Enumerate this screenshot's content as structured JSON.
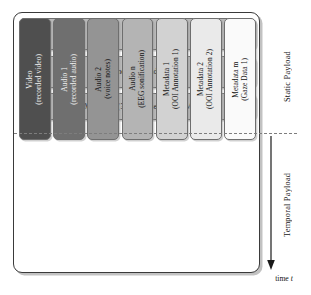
{
  "diagram": {
    "static_section": {
      "label": "Static Payload",
      "bars": [
        {
          "id": "header",
          "label": "Header",
          "fill": "#b9b9b9"
        },
        {
          "id": "general",
          "label": "General Metadata",
          "fill": "#b9b9b9"
        },
        {
          "id": "specific",
          "label": "Specific Metadata (3D representation, Maps etc.)",
          "fill": "#b9b9b9"
        }
      ]
    },
    "temporal_section": {
      "label": "Temporal Payload",
      "axis_caption_prefix": "time ",
      "axis_caption_variable": "t",
      "arrow_direction": "down",
      "columns": [
        {
          "id": "video",
          "line1": "Video",
          "line2": "(recorded video)",
          "label": "Video\n(recorded video)",
          "fill": "#4f4f4f",
          "text_color": "#f2f2f2"
        },
        {
          "id": "audio-1",
          "line1": "Audio 1",
          "line2": "(recorded audio)",
          "label": "Audio 1\n(recorded audio)",
          "fill": "#6f6f6f",
          "text_color": "#f2f2f2"
        },
        {
          "id": "audio-2",
          "line1": "Audio 2",
          "line2": "(voice notes)",
          "label": "Audio 2\n(voice notes)",
          "fill": "#949494",
          "text_color": "#121212"
        },
        {
          "id": "audio-n",
          "line1": "Audio n",
          "line2": "(EEG sonification)",
          "label": "Audio n\n(EEG sonification)",
          "fill": "#b4b4b4",
          "text_color": "#121212"
        },
        {
          "id": "metadata-1",
          "line1": "Metadata 1",
          "line2": "(OOI Annotation 1)",
          "label": "Metadata 1\n(OOI Annotation 1)",
          "fill": "#d2d2d2",
          "text_color": "#121212"
        },
        {
          "id": "metadata-2",
          "line1": "Metadata 2",
          "line2": "(OOI Annotation 2)",
          "label": "Metadata 2\n(OOI Annotation 2)",
          "fill": "#eaeaea",
          "text_color": "#121212"
        },
        {
          "id": "metadata-m",
          "line1": "Metadata m",
          "line2": "(Gaze Data 1)",
          "label": "Metadata m\n(Gaze Data 1)",
          "fill": "#fafafa",
          "text_color": "#121212"
        }
      ]
    },
    "colors": {
      "container_border": "#3a3a3a",
      "bar_border": "#6e6e6e",
      "separator": "#7d7d7d",
      "background": "#ffffff"
    }
  }
}
